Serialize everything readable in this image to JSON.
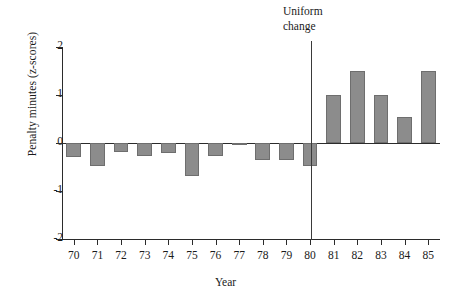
{
  "chart_data": {
    "type": "bar",
    "title": "",
    "subtitle": "",
    "xlabel": "Year",
    "ylabel": "Penalty minutes (z-scores)",
    "categories": [
      "70",
      "71",
      "72",
      "73",
      "74",
      "75",
      "76",
      "77",
      "78",
      "79",
      "80",
      "81",
      "82",
      "83",
      "84",
      "85"
    ],
    "values": [
      -0.3,
      -0.48,
      -0.18,
      -0.28,
      -0.2,
      -0.68,
      -0.28,
      -0.05,
      -0.35,
      -0.35,
      -0.47,
      1.0,
      1.5,
      1.0,
      0.55,
      1.5
    ],
    "ylim": [
      -2,
      2
    ],
    "y_ticks": [
      "2",
      "1",
      "0",
      "-1",
      "-2"
    ],
    "y_tick_values": [
      2,
      1,
      0,
      -1,
      -2
    ],
    "grid": false,
    "legend": null,
    "bar_color": "#8c8c8c",
    "bar_border_color": "#6e6e6e",
    "axis_color": "#2b2b2b",
    "annotations": [
      {
        "text": "Uniform\nchange",
        "line_x_category": "80.5",
        "type": "vertical-rule-with-label"
      }
    ]
  },
  "figure": {
    "annotation_text": "Uniform\nchange",
    "x_axis_title": "Year",
    "y_axis_title": "Penalty minutes (z-scores)"
  }
}
